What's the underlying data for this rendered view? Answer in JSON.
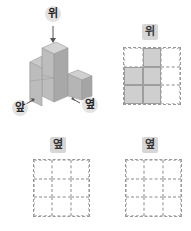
{
  "figure": {
    "cube_view_labels": {
      "top": "위",
      "front": "앞",
      "side": "옆"
    },
    "views": [
      {
        "label": "위",
        "grid": [
          [
            0,
            1,
            0
          ],
          [
            1,
            1,
            0
          ],
          [
            1,
            1,
            0
          ]
        ]
      },
      {
        "label": "옆",
        "grid": [
          [
            0,
            0,
            0
          ],
          [
            0,
            0,
            0
          ],
          [
            0,
            0,
            0
          ]
        ]
      },
      {
        "label": "옆",
        "grid": [
          [
            0,
            0,
            0
          ],
          [
            0,
            0,
            0
          ],
          [
            0,
            0,
            0
          ]
        ]
      }
    ],
    "colors": {
      "cube_fill": "#b5b5b5",
      "grid_fill": "#cfcfcf",
      "label_bg": "#d6d6d6"
    }
  }
}
